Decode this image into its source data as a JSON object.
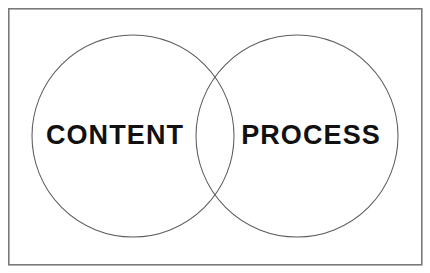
{
  "diagram": {
    "type": "venn",
    "title": "",
    "background_color": "#ffffff",
    "frame": {
      "border_color": "#7a7a7a",
      "fill_color": "#ffffff",
      "x": 8,
      "y": 8,
      "width": 414,
      "height": 257
    },
    "circle_stroke_color": "#5d5d5d",
    "label_color": "#111111",
    "sets": [
      {
        "id": "content",
        "label": "CONTENT",
        "center_x": 133,
        "center_y": 136,
        "radius": 101,
        "label_x": 115,
        "label_y": 136
      },
      {
        "id": "process",
        "label": "PROCESS",
        "center_x": 297,
        "center_y": 136,
        "radius": 101,
        "label_x": 311,
        "label_y": 136
      }
    ],
    "intersection": {
      "label": "",
      "top_point_y": 70,
      "bottom_point_y": 201,
      "center_x": 215
    }
  }
}
